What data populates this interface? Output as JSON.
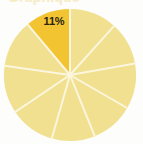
{
  "page": {
    "background_color": "#fdfdfb",
    "width": 143,
    "height": 144,
    "clipped_title": "Graphique"
  },
  "chart_data": {
    "type": "pie",
    "title": "",
    "xlabel": "",
    "ylabel": "",
    "grid": false,
    "legend_position": "none",
    "center": {
      "x": 70,
      "y": 75
    },
    "radius": 66,
    "start_angle_deg": -90,
    "direction": "counterclockwise",
    "separator_color": "#fbf6dd",
    "separator_width": 2,
    "highlight_color": "#f2c431",
    "base_color": "#f0e08f",
    "labels": [
      "11%"
    ],
    "categories": [
      "Slice 1",
      "Slice 2",
      "Slice 3",
      "Slice 4",
      "Slice 5",
      "Slice 6",
      "Slice 7",
      "Slice 8",
      "Slice 9"
    ],
    "values": [
      11,
      11,
      11,
      11,
      11,
      11,
      11,
      11,
      12
    ],
    "slices": [
      {
        "name": "Slice 1",
        "value": 11,
        "label": "11%",
        "highlighted": true,
        "color": "#f2c431",
        "start_deg": -90,
        "end_deg": -130,
        "label_x": 54,
        "label_y": 21
      },
      {
        "name": "Slice 2",
        "value": 11,
        "label": "",
        "highlighted": false,
        "color": "#f0e08f",
        "start_deg": -130,
        "end_deg": -172
      },
      {
        "name": "Slice 3",
        "value": 11,
        "label": "",
        "highlighted": false,
        "color": "#f0e08f",
        "start_deg": -172,
        "end_deg": -214
      },
      {
        "name": "Slice 4",
        "value": 11,
        "label": "",
        "highlighted": false,
        "color": "#f0e08f",
        "start_deg": -214,
        "end_deg": -254
      },
      {
        "name": "Slice 5",
        "value": 11,
        "label": "",
        "highlighted": false,
        "color": "#f0e08f",
        "start_deg": -254,
        "end_deg": -292
      },
      {
        "name": "Slice 6",
        "value": 11,
        "label": "",
        "highlighted": false,
        "color": "#f0e08f",
        "start_deg": -292,
        "end_deg": -330
      },
      {
        "name": "Slice 7",
        "value": 11,
        "label": "",
        "highlighted": false,
        "color": "#f0e08f",
        "start_deg": -330,
        "end_deg": -370
      },
      {
        "name": "Slice 8",
        "value": 11,
        "label": "",
        "highlighted": false,
        "color": "#f0e08f",
        "start_deg": -370,
        "end_deg": -408
      },
      {
        "name": "Slice 9",
        "value": 12,
        "label": "",
        "highlighted": false,
        "color": "#f0e08f",
        "start_deg": -408,
        "end_deg": -450
      }
    ]
  }
}
